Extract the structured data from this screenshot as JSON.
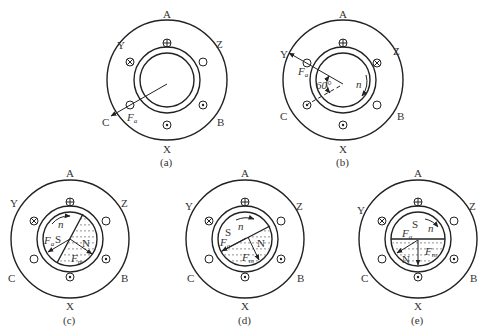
{
  "figure": {
    "panels": [
      {
        "id": "a",
        "caption": "(a)",
        "phase_labels": {
          "A": "A",
          "Z": "Z",
          "B": "B",
          "X": "X",
          "C": "C",
          "Y": "Y"
        },
        "vector_labels": {
          "Fa": "F",
          "Fa_sub": "a"
        },
        "angle_label": "",
        "speed_label": ""
      },
      {
        "id": "b",
        "caption": "(b)",
        "phase_labels": {
          "A": "A",
          "Z": "Z",
          "B": "B",
          "X": "X",
          "C": "C",
          "Y": "Y"
        },
        "vector_labels": {
          "Fa": "F",
          "Fa_sub": "a"
        },
        "angle_label": "60°",
        "speed_label": "n"
      },
      {
        "id": "c",
        "caption": "(c)",
        "phase_labels": {
          "A": "A",
          "Z": "Z",
          "B": "B",
          "X": "X",
          "C": "C",
          "Y": "Y"
        },
        "vector_labels": {
          "Fa": "F",
          "Fa_sub": "a",
          "Fm": "F",
          "Fm_sub": "m"
        },
        "pole_labels": {
          "S": "S",
          "N": "N"
        },
        "speed_label": "n"
      },
      {
        "id": "d",
        "caption": "(d)",
        "phase_labels": {
          "A": "A",
          "Z": "Z",
          "B": "B",
          "X": "X",
          "C": "C",
          "Y": "Y"
        },
        "vector_labels": {
          "Fa": "F",
          "Fa_sub": "a",
          "Fm": "F",
          "Fm_sub": "m"
        },
        "pole_labels": {
          "S": "S",
          "N": "N"
        },
        "speed_label": "n"
      },
      {
        "id": "e",
        "caption": "(e)",
        "phase_labels": {
          "A": "A",
          "Z": "Z",
          "B": "B",
          "X": "X",
          "C": "C",
          "Y": "Y"
        },
        "vector_labels": {
          "Fa": "F",
          "Fa_sub": "a",
          "Fm": "F",
          "Fm_sub": "m"
        },
        "pole_labels": {
          "S": "S",
          "N": "N"
        },
        "speed_label": "n"
      }
    ],
    "conductor_symbols": {
      "into_page": "cross-in-circle",
      "out_of_page": "dot-in-circle",
      "no_current": "empty-circle"
    },
    "colors": {
      "line": "#222222",
      "text": "#333333",
      "background": "#ffffff",
      "hatch": "#555555"
    }
  }
}
